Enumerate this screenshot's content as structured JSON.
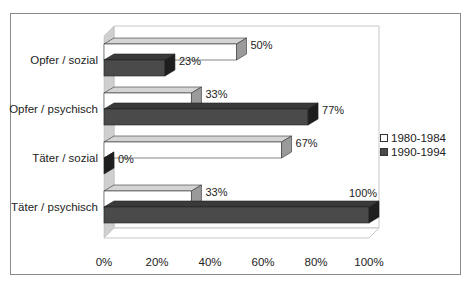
{
  "chart_data": {
    "type": "bar",
    "orientation": "horizontal",
    "style": "3d",
    "title": "",
    "xlabel": "",
    "ylabel": "",
    "categories": [
      "Opfer / sozial",
      "Opfer / psychisch",
      "Täter / sozial",
      "Täter / psychisch"
    ],
    "series": [
      {
        "name": "1980-1984",
        "values": [
          50,
          33,
          67,
          33
        ],
        "color": "#ffffff"
      },
      {
        "name": "1990-1994",
        "values": [
          23,
          77,
          0,
          100
        ],
        "color": "#4a4a4a"
      }
    ],
    "value_labels": {
      "1980-1984": [
        "50%",
        "33%",
        "67%",
        "33%"
      ],
      "1990-1994": [
        "23%",
        "77%",
        "0%",
        "100%"
      ]
    },
    "xlim": [
      0,
      100
    ],
    "x_ticks": [
      "0%",
      "20%",
      "40%",
      "60%",
      "80%",
      "100%"
    ],
    "grid": false,
    "legend_position": "right"
  },
  "legend": {
    "items": [
      {
        "label": "1980-1984",
        "color": "#ffffff"
      },
      {
        "label": "1990-1994",
        "color": "#4a4a4a"
      }
    ]
  }
}
